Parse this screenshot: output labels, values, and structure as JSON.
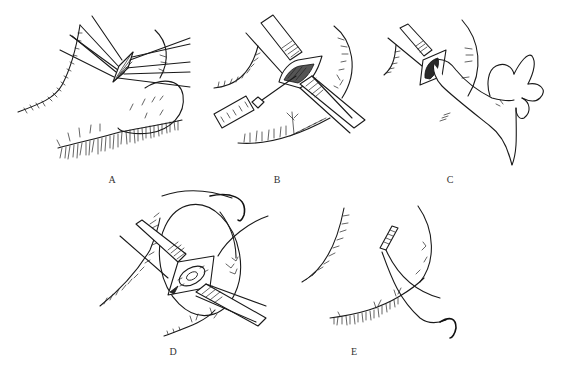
{
  "figure": {
    "panels": [
      {
        "id": "A",
        "label": "A",
        "content": "Eyelid retracted with multiple traction sutures radiating from a central incision"
      },
      {
        "id": "B",
        "label": "B",
        "content": "Two retractors holding incision open while a syringe injects at the site"
      },
      {
        "id": "C",
        "label": "C",
        "content": "Finger pressing on the opened incision between retractors"
      },
      {
        "id": "D",
        "label": "D",
        "content": "Retractors exposing the lesion with a curved suture needle passing around it"
      },
      {
        "id": "E",
        "label": "E",
        "content": "Closed lid margin with suture ends and curved needle"
      }
    ],
    "colors": {
      "ink": "#1a1a1a",
      "background": "#ffffff",
      "label": "#333333"
    }
  }
}
